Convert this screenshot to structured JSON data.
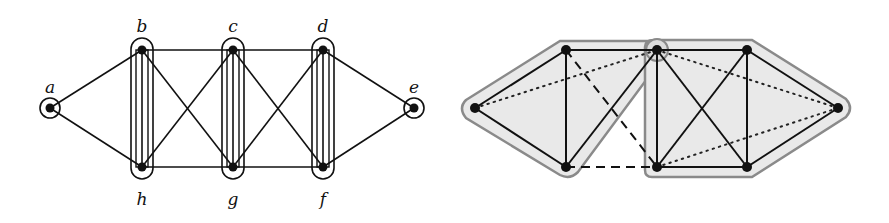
{
  "left_graph": {
    "nodes": [
      {
        "id": "a",
        "label": "a",
        "x": 50,
        "y": 108,
        "lx": 50,
        "ly": 88
      },
      {
        "id": "b",
        "label": "b",
        "x": 142,
        "y": 50,
        "lx": 142,
        "ly": 27
      },
      {
        "id": "c",
        "label": "c",
        "x": 233,
        "y": 50,
        "lx": 233,
        "ly": 27
      },
      {
        "id": "d",
        "label": "d",
        "x": 323,
        "y": 50,
        "lx": 323,
        "ly": 27
      },
      {
        "id": "e",
        "label": "e",
        "x": 414,
        "y": 108,
        "lx": 414,
        "ly": 88
      },
      {
        "id": "f",
        "label": "f",
        "x": 323,
        "y": 167,
        "lx": 323,
        "ly": 200
      },
      {
        "id": "g",
        "label": "g",
        "x": 233,
        "y": 167,
        "lx": 233,
        "ly": 200
      },
      {
        "id": "h",
        "label": "h",
        "x": 142,
        "y": 167,
        "lx": 142,
        "ly": 200
      }
    ],
    "edges": [
      [
        "a",
        "b"
      ],
      [
        "a",
        "h"
      ],
      [
        "b",
        "c"
      ],
      [
        "c",
        "d"
      ],
      [
        "h",
        "g"
      ],
      [
        "g",
        "f"
      ],
      [
        "d",
        "e"
      ],
      [
        "f",
        "e"
      ],
      [
        "b",
        "h"
      ],
      [
        "c",
        "g"
      ],
      [
        "d",
        "f"
      ],
      [
        "b",
        "g"
      ],
      [
        "h",
        "c"
      ],
      [
        "c",
        "f"
      ],
      [
        "g",
        "d"
      ]
    ],
    "singleton_groups": [
      "a",
      "e"
    ],
    "pair_groups": [
      [
        "b",
        "h"
      ],
      [
        "c",
        "g"
      ],
      [
        "d",
        "f"
      ]
    ]
  },
  "right_graph": {
    "nodes": [
      {
        "id": "L",
        "x": 475,
        "y": 108
      },
      {
        "id": "T1",
        "x": 566,
        "y": 50
      },
      {
        "id": "B1",
        "x": 566,
        "y": 167
      },
      {
        "id": "T2",
        "x": 657,
        "y": 50
      },
      {
        "id": "B2",
        "x": 657,
        "y": 167
      },
      {
        "id": "T3",
        "x": 747,
        "y": 50
      },
      {
        "id": "B3",
        "x": 747,
        "y": 167
      },
      {
        "id": "R",
        "x": 838,
        "y": 108
      }
    ],
    "solid_edges": [
      [
        "L",
        "T1"
      ],
      [
        "L",
        "B1"
      ],
      [
        "T1",
        "B1"
      ],
      [
        "T1",
        "T2"
      ],
      [
        "B1",
        "T2"
      ],
      [
        "T2",
        "B2"
      ],
      [
        "T2",
        "T3"
      ],
      [
        "B2",
        "B3"
      ],
      [
        "T3",
        "B3"
      ],
      [
        "T2",
        "B3"
      ],
      [
        "B2",
        "T3"
      ],
      [
        "T3",
        "R"
      ],
      [
        "B3",
        "R"
      ]
    ],
    "dashed_edges": [
      [
        "T1",
        "B2"
      ],
      [
        "B1",
        "B2"
      ]
    ],
    "dotted_edges": [
      [
        "L",
        "T2"
      ],
      [
        "T2",
        "R"
      ],
      [
        "B2",
        "R"
      ]
    ],
    "hull_fill": "#e8e8e8",
    "hull_stroke": "#8a8a8a"
  }
}
